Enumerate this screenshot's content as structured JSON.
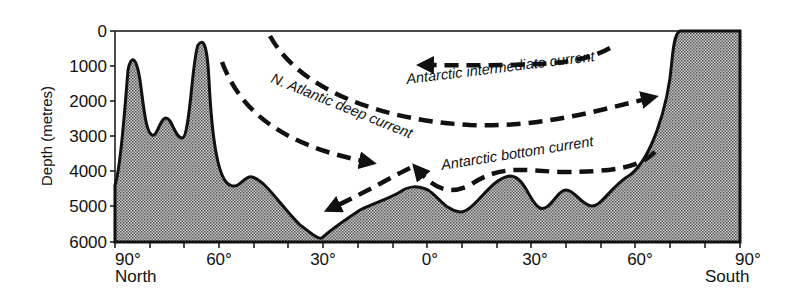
{
  "diagram": {
    "type": "ocean-cross-section",
    "yaxis": {
      "title": "Depth (metres)",
      "ticks": [
        "0",
        "1000",
        "2000",
        "3000",
        "4000",
        "5000",
        "6000"
      ]
    },
    "xaxis": {
      "ticks": [
        "90°",
        "60°",
        "30°",
        "0°",
        "30°",
        "60°",
        "90°"
      ],
      "left_label": "North",
      "right_label": "South"
    },
    "currents": [
      {
        "label": "N. Atlantic deep current",
        "direction": "north-to-south"
      },
      {
        "label": "Antarctic intermediate current",
        "direction": "south-to-north"
      },
      {
        "label": "Antarctic bottom current",
        "direction": "south-to-north"
      }
    ],
    "colors": {
      "seafloor_fill": "#8a8a8a",
      "outline": "#111111",
      "background": "#ffffff"
    }
  }
}
